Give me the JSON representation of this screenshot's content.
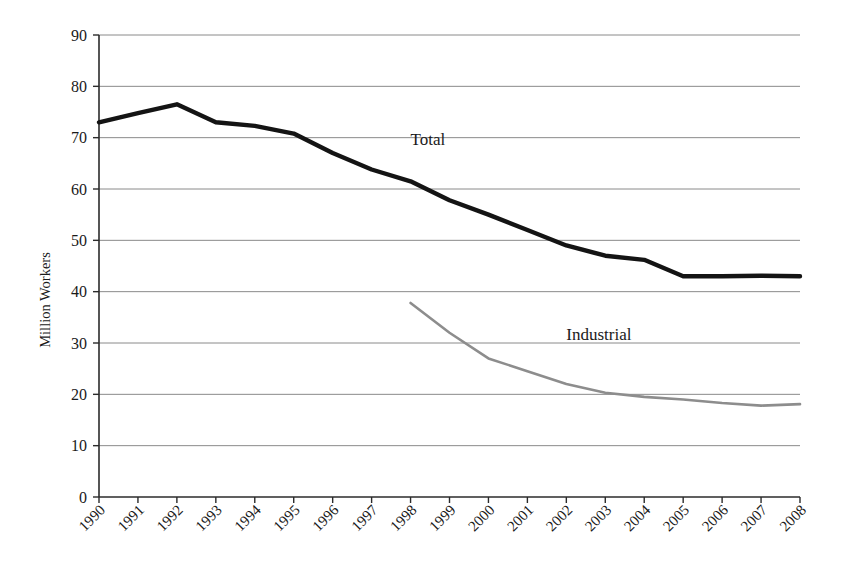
{
  "chart_data": {
    "type": "line",
    "title": "",
    "xlabel": "",
    "ylabel": "Million Workers",
    "ylim": [
      0,
      90
    ],
    "ytick_step": 10,
    "yticks": [
      "0",
      "10",
      "20",
      "30",
      "40",
      "50",
      "60",
      "70",
      "80",
      "90"
    ],
    "grid": true,
    "legend_position": "inline-annotation",
    "categories": [
      "1990",
      "1991",
      "1992",
      "1993",
      "1994",
      "1995",
      "1996",
      "1997",
      "1998",
      "1999",
      "2000",
      "2001",
      "2002",
      "2003",
      "2004",
      "2005",
      "2006",
      "2007",
      "2008"
    ],
    "series": [
      {
        "name": "Total",
        "color": "#141414",
        "values": [
          73.0,
          74.8,
          76.5,
          73.0,
          72.3,
          70.8,
          67.0,
          63.8,
          61.5,
          57.8,
          55.0,
          52.0,
          49.0,
          47.0,
          46.2,
          43.0,
          43.0,
          43.1,
          43.0
        ]
      },
      {
        "name": "Industrial",
        "color": "#8d8d8d",
        "values": [
          null,
          null,
          null,
          null,
          null,
          null,
          null,
          null,
          37.8,
          32.0,
          27.0,
          24.5,
          22.0,
          20.3,
          19.5,
          19.0,
          18.3,
          17.8,
          18.1
        ]
      }
    ],
    "annotations": [
      {
        "text": "Total",
        "x_value": "1998",
        "y_value": 68.5
      },
      {
        "text": "Industrial",
        "x_value": "2002",
        "y_value": 30.5
      }
    ]
  },
  "axes": {
    "y_title": "Million Workers"
  }
}
